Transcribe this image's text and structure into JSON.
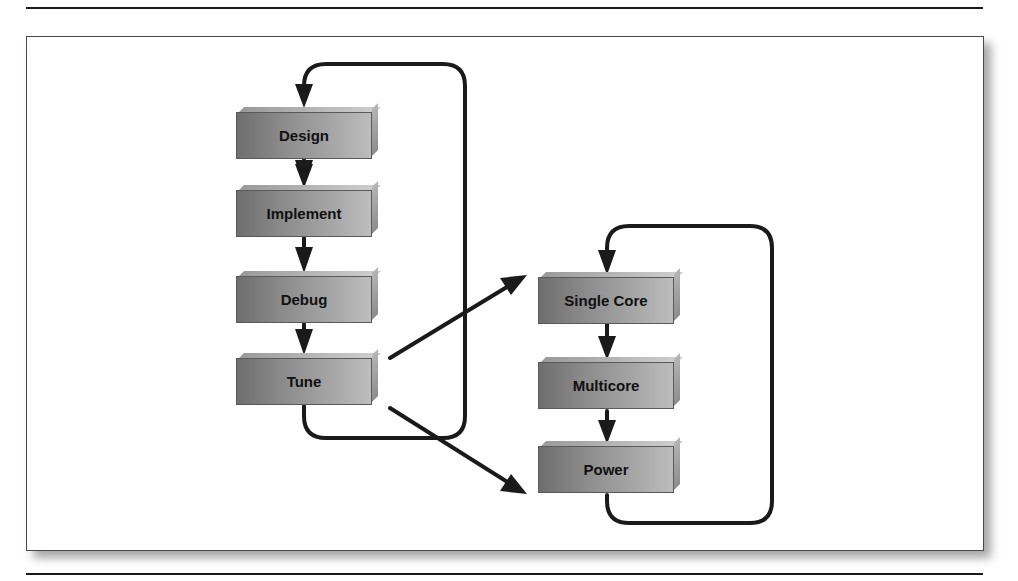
{
  "diagram": {
    "left_loop": {
      "steps": [
        {
          "label": "Design"
        },
        {
          "label": "Implement"
        },
        {
          "label": "Debug"
        },
        {
          "label": "Tune"
        }
      ]
    },
    "right_loop": {
      "steps": [
        {
          "label": "Single Core"
        },
        {
          "label": "Multicore"
        },
        {
          "label": "Power"
        }
      ]
    },
    "edges": [
      {
        "from": "Design",
        "to": "Implement"
      },
      {
        "from": "Implement",
        "to": "Debug"
      },
      {
        "from": "Debug",
        "to": "Tune"
      },
      {
        "from": "Tune",
        "to": "Design",
        "type": "loop-back"
      },
      {
        "from": "Tune",
        "to": "Single Core"
      },
      {
        "from": "Tune",
        "to": "Power"
      },
      {
        "from": "Single Core",
        "to": "Multicore"
      },
      {
        "from": "Multicore",
        "to": "Power"
      },
      {
        "from": "Power",
        "to": "Single Core",
        "type": "loop-back"
      }
    ],
    "colors": {
      "box_fill": "#8c8c8c",
      "line": "#1a1a1a",
      "background": "#ffffff"
    }
  }
}
